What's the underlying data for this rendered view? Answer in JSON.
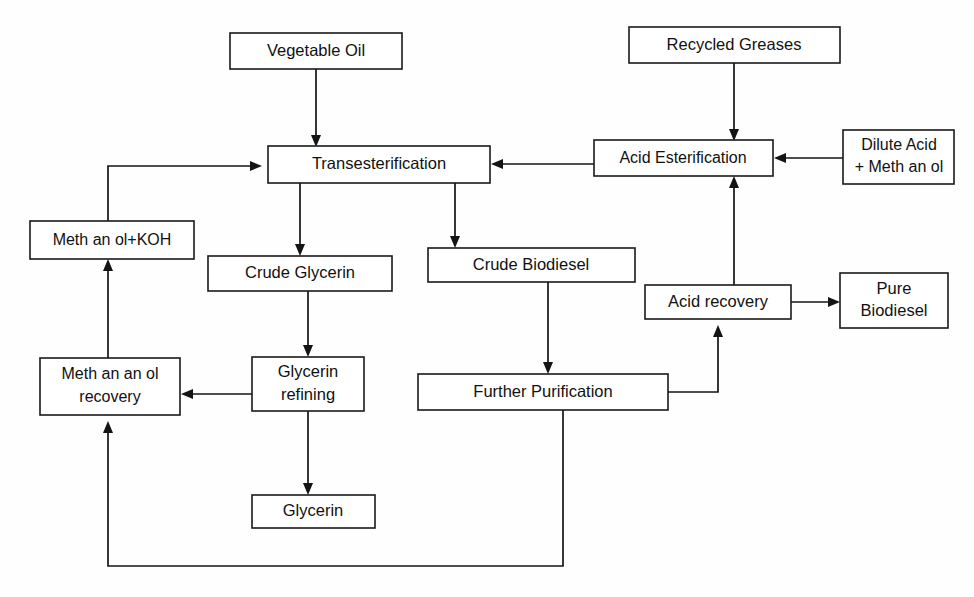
{
  "diagram": {
    "type": "process-flowchart",
    "background_color": "#fefefe",
    "line_color": "#141414",
    "box_fill": "#ffffff",
    "box_stroke": "#1a1a1a",
    "nodes": [
      {
        "id": "vegetable-oil",
        "label": "Vegetable Oil",
        "line1": "Vegetable Oil",
        "line2": "",
        "x": 230,
        "y": 33,
        "w": 172,
        "h": 36
      },
      {
        "id": "recycled-greases",
        "label": "Recycled Greases",
        "line1": "Recycled Greases",
        "line2": "",
        "x": 629,
        "y": 27,
        "w": 211,
        "h": 36
      },
      {
        "id": "transesterification",
        "label": "Transesterification",
        "line1": "Transesterification",
        "line2": "",
        "x": 268,
        "y": 146,
        "w": 222,
        "h": 37
      },
      {
        "id": "acid-esterification",
        "label": "Acid Esterification",
        "line1": "Acid Esterification",
        "line2": "",
        "x": 594,
        "y": 140,
        "w": 179,
        "h": 36
      },
      {
        "id": "dilute-acid-methanol",
        "label": "Dilute Acid + Meth an ol",
        "line1": "Dilute Acid",
        "line2": "+ Meth an ol",
        "x": 843,
        "y": 130,
        "w": 111,
        "h": 54
      },
      {
        "id": "methanol-koh",
        "label": "Meth an ol+KOH",
        "line1": "Meth an ol+KOH",
        "line2": "",
        "x": 30,
        "y": 221,
        "w": 164,
        "h": 38
      },
      {
        "id": "crude-glycerin",
        "label": "Crude Glycerin",
        "line1": "Crude Glycerin",
        "line2": "",
        "x": 208,
        "y": 256,
        "w": 184,
        "h": 35
      },
      {
        "id": "crude-biodiesel",
        "label": "Crude Biodiesel",
        "line1": "Crude Biodiesel",
        "line2": "",
        "x": 428,
        "y": 248,
        "w": 207,
        "h": 34
      },
      {
        "id": "acid-recovery",
        "label": "Acid recovery",
        "line1": "Acid recovery",
        "line2": "",
        "x": 645,
        "y": 285,
        "w": 146,
        "h": 34
      },
      {
        "id": "pure-biodiesel",
        "label": "Pure Biodiesel",
        "line1": "Pure",
        "line2": "Biodiesel",
        "x": 840,
        "y": 273,
        "w": 108,
        "h": 55
      },
      {
        "id": "methanol-recovery",
        "label": "Meth an an ol recovery",
        "line1": "Meth an an ol",
        "line2": "recovery",
        "x": 40,
        "y": 358,
        "w": 140,
        "h": 57
      },
      {
        "id": "glycerin-refining",
        "label": "Glycerin refining",
        "line1": "Glycerin",
        "line2": "refining",
        "x": 252,
        "y": 357,
        "w": 112,
        "h": 54
      },
      {
        "id": "further-purification",
        "label": "Further Purification",
        "line1": "Further Purification",
        "line2": "",
        "x": 418,
        "y": 374,
        "w": 250,
        "h": 36
      },
      {
        "id": "glycerin",
        "label": "Glycerin",
        "line1": "Glycerin",
        "line2": "",
        "x": 252,
        "y": 495,
        "w": 123,
        "h": 33
      }
    ],
    "edges": [
      {
        "id": "edge-vegetable-oil-to-transesterification",
        "from": "vegetable-oil",
        "to": "transesterification",
        "label": ""
      },
      {
        "id": "edge-methanol-koh-to-transesterification",
        "from": "methanol-koh",
        "to": "transesterification",
        "label": ""
      },
      {
        "id": "edge-recycled-greases-to-acid-esterification",
        "from": "recycled-greases",
        "to": "acid-esterification",
        "label": ""
      },
      {
        "id": "edge-dilute-acid-to-acid-esterification",
        "from": "dilute-acid-methanol",
        "to": "acid-esterification",
        "label": ""
      },
      {
        "id": "edge-acid-esterification-to-transesterification",
        "from": "acid-esterification",
        "to": "transesterification",
        "label": ""
      },
      {
        "id": "edge-transesterification-to-crude-glycerin",
        "from": "transesterification",
        "to": "crude-glycerin",
        "label": ""
      },
      {
        "id": "edge-transesterification-to-crude-biodiesel",
        "from": "transesterification",
        "to": "crude-biodiesel",
        "label": ""
      },
      {
        "id": "edge-crude-glycerin-to-glycerin-refining",
        "from": "crude-glycerin",
        "to": "glycerin-refining",
        "label": ""
      },
      {
        "id": "edge-glycerin-refining-to-methanol-recovery",
        "from": "glycerin-refining",
        "to": "methanol-recovery",
        "label": ""
      },
      {
        "id": "edge-glycerin-refining-to-glycerin",
        "from": "glycerin-refining",
        "to": "glycerin",
        "label": ""
      },
      {
        "id": "edge-methanol-recovery-to-methanol-koh",
        "from": "methanol-recovery",
        "to": "methanol-koh",
        "label": ""
      },
      {
        "id": "edge-crude-biodiesel-to-further-purification",
        "from": "crude-biodiesel",
        "to": "further-purification",
        "label": ""
      },
      {
        "id": "edge-further-purification-to-acid-recovery",
        "from": "further-purification",
        "to": "acid-recovery",
        "label": ""
      },
      {
        "id": "edge-acid-recovery-to-acid-esterification",
        "from": "acid-recovery",
        "to": "acid-esterification",
        "label": ""
      },
      {
        "id": "edge-acid-recovery-to-pure-biodiesel",
        "from": "acid-recovery",
        "to": "pure-biodiesel",
        "label": ""
      },
      {
        "id": "edge-further-purification-to-methanol-recovery",
        "from": "further-purification",
        "to": "methanol-recovery",
        "label": ""
      }
    ]
  }
}
